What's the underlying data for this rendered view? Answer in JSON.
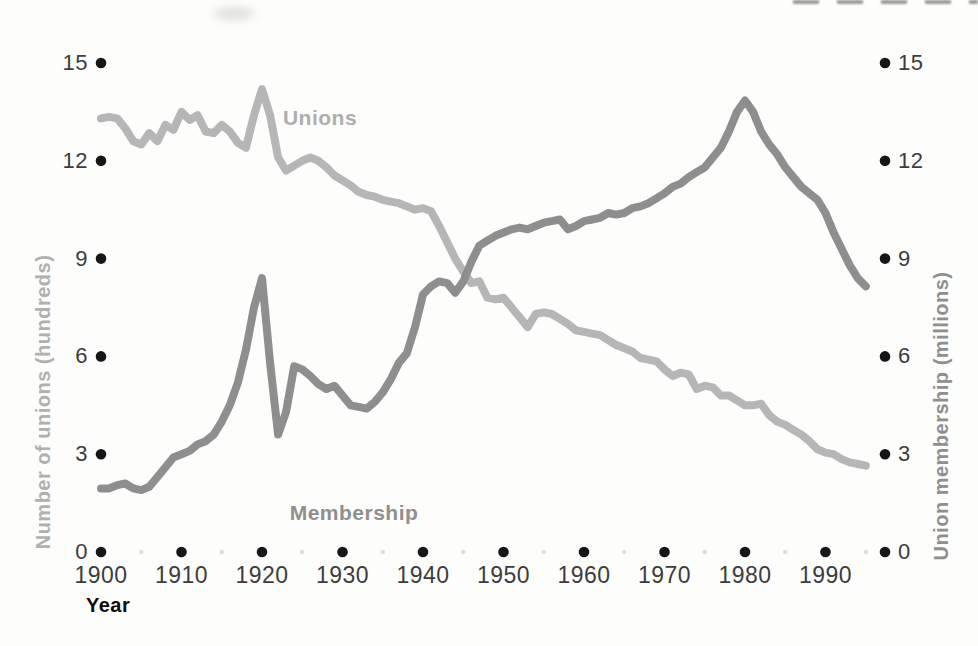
{
  "figure": {
    "left_axis": {
      "label": "Number of unions (hundreds)",
      "ticks": [
        0,
        3,
        6,
        9,
        12,
        15
      ]
    },
    "right_axis": {
      "label": "Union membership (millions)",
      "ticks": [
        0,
        3,
        6,
        9,
        12,
        15
      ]
    },
    "x_axis": {
      "label": "Year",
      "ticks": [
        1900,
        1910,
        1920,
        1930,
        1940,
        1950,
        1960,
        1970,
        1980,
        1990
      ],
      "minor_ticks": [
        1905,
        1915,
        1925,
        1935,
        1945,
        1955,
        1965,
        1975,
        1985,
        1995
      ]
    },
    "series_labels": {
      "unions": "Unions",
      "membership": "Membership"
    },
    "colors": {
      "unions_line": "#b6b6b6",
      "membership_line": "#8e8e8e",
      "tick_dot": "#161616",
      "minor_dot": "#dedede",
      "tick_text": "#3c3c3c"
    }
  },
  "chart_data": {
    "type": "line",
    "title": "",
    "xlabel": "Year",
    "ylabel_left": "Number of unions (hundreds)",
    "ylabel_right": "Union membership (millions)",
    "x_range": [
      1900,
      1995
    ],
    "ylim": [
      0,
      15
    ],
    "grid": false,
    "legend_position": "inline-labels",
    "x": [
      1900,
      1901,
      1902,
      1903,
      1904,
      1905,
      1906,
      1907,
      1908,
      1909,
      1910,
      1911,
      1912,
      1913,
      1914,
      1915,
      1916,
      1917,
      1918,
      1919,
      1920,
      1921,
      1922,
      1923,
      1924,
      1925,
      1926,
      1927,
      1928,
      1929,
      1930,
      1931,
      1932,
      1933,
      1934,
      1935,
      1936,
      1937,
      1938,
      1939,
      1940,
      1941,
      1942,
      1943,
      1944,
      1945,
      1946,
      1947,
      1948,
      1949,
      1950,
      1951,
      1952,
      1953,
      1954,
      1955,
      1956,
      1957,
      1958,
      1959,
      1960,
      1961,
      1962,
      1963,
      1964,
      1965,
      1966,
      1967,
      1968,
      1969,
      1970,
      1971,
      1972,
      1973,
      1974,
      1975,
      1976,
      1977,
      1978,
      1979,
      1980,
      1981,
      1982,
      1983,
      1984,
      1985,
      1986,
      1987,
      1988,
      1989,
      1990,
      1991,
      1992,
      1993,
      1994,
      1995
    ],
    "series": [
      {
        "name": "Unions",
        "axis": "left",
        "values": [
          13.3,
          13.35,
          13.3,
          13.0,
          12.6,
          12.5,
          12.85,
          12.6,
          13.1,
          12.95,
          13.5,
          13.25,
          13.4,
          12.9,
          12.85,
          13.1,
          12.9,
          12.55,
          12.4,
          13.4,
          14.2,
          13.4,
          12.1,
          11.7,
          11.85,
          12.0,
          12.1,
          12.0,
          11.8,
          11.55,
          11.4,
          11.25,
          11.05,
          10.95,
          10.9,
          10.8,
          10.75,
          10.7,
          10.6,
          10.5,
          10.55,
          10.45,
          10.0,
          9.5,
          9.0,
          8.6,
          8.25,
          8.3,
          7.8,
          7.75,
          7.8,
          7.5,
          7.2,
          6.9,
          7.3,
          7.35,
          7.3,
          7.15,
          7.0,
          6.8,
          6.75,
          6.7,
          6.65,
          6.5,
          6.35,
          6.25,
          6.15,
          5.95,
          5.9,
          5.85,
          5.6,
          5.4,
          5.5,
          5.45,
          5.0,
          5.1,
          5.05,
          4.8,
          4.8,
          4.65,
          4.5,
          4.5,
          4.55,
          4.2,
          4.0,
          3.9,
          3.75,
          3.6,
          3.4,
          3.15,
          3.05,
          3.0,
          2.85,
          2.75,
          2.7,
          2.65
        ]
      },
      {
        "name": "Membership",
        "axis": "right",
        "values": [
          1.95,
          1.95,
          2.05,
          2.1,
          1.95,
          1.9,
          2.0,
          2.3,
          2.6,
          2.9,
          3.0,
          3.1,
          3.3,
          3.4,
          3.6,
          4.0,
          4.5,
          5.2,
          6.2,
          7.5,
          8.4,
          5.8,
          3.6,
          4.3,
          5.7,
          5.6,
          5.4,
          5.15,
          5.0,
          5.1,
          4.8,
          4.5,
          4.45,
          4.4,
          4.6,
          4.9,
          5.3,
          5.8,
          6.1,
          6.9,
          7.9,
          8.15,
          8.3,
          8.25,
          7.95,
          8.3,
          8.9,
          9.4,
          9.55,
          9.7,
          9.8,
          9.9,
          9.95,
          9.9,
          10.0,
          10.1,
          10.15,
          10.2,
          9.9,
          10.0,
          10.15,
          10.2,
          10.25,
          10.4,
          10.35,
          10.4,
          10.55,
          10.6,
          10.7,
          10.85,
          11.0,
          11.2,
          11.3,
          11.5,
          11.65,
          11.8,
          12.1,
          12.4,
          12.9,
          13.5,
          13.85,
          13.5,
          12.9,
          12.5,
          12.2,
          11.8,
          11.5,
          11.2,
          11.0,
          10.8,
          10.4,
          9.8,
          9.3,
          8.8,
          8.4,
          8.15
        ]
      }
    ]
  }
}
